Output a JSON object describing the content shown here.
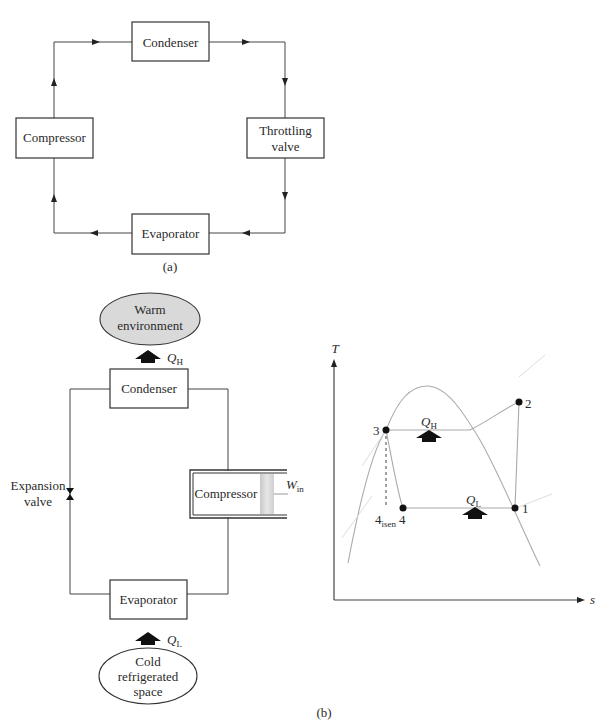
{
  "figure_a": {
    "caption": "(a)",
    "components": {
      "condenser": "Condenser",
      "compressor": "Compressor",
      "throttling_valve_line1": "Throttling",
      "throttling_valve_line2": "valve",
      "evaporator": "Evaporator"
    }
  },
  "figure_b": {
    "caption": "(b)",
    "schematic": {
      "warm_env_line1": "Warm",
      "warm_env_line2": "environment",
      "q_high": "Q",
      "q_high_sub": "H",
      "condenser": "Condenser",
      "expansion_valve_line1": "Expansion",
      "expansion_valve_line2": "valve",
      "compressor": "Compressor",
      "work_in": "W",
      "work_in_sub": "in",
      "evaporator": "Evaporator",
      "q_low": "Q",
      "q_low_sub": "L",
      "cold_space_line1": "Cold",
      "cold_space_line2": "refrigerated",
      "cold_space_line3": "space"
    },
    "ts_diagram": {
      "y_axis": "T",
      "x_axis": "s",
      "points": {
        "p1": "1",
        "p2": "2",
        "p3": "3",
        "p4": "4",
        "p4isen": "4",
        "p4isen_sub": "isen"
      },
      "q_high": "Q",
      "q_high_sub": "H",
      "q_low": "Q",
      "q_low_sub": "L"
    }
  },
  "colors": {
    "ellipse_fill": "#d9d9d9",
    "line": "#444444",
    "curve": "#aaaaaa",
    "arrow": "#111111"
  }
}
